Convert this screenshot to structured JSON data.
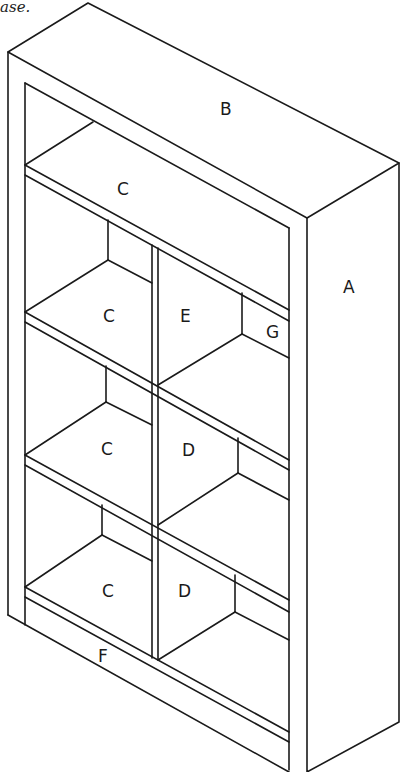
{
  "caption": "ase.",
  "diagram": {
    "labels": {
      "side_panel": "A",
      "top_panel": "B",
      "top_shelf": "C",
      "shelf_left_upper": "C",
      "shelf_left_middle": "C",
      "shelf_left_lower": "C",
      "divider_upper": "E",
      "back_brace": "G",
      "divider_middle": "D",
      "divider_lower": "D",
      "kick_plate": "F"
    }
  }
}
